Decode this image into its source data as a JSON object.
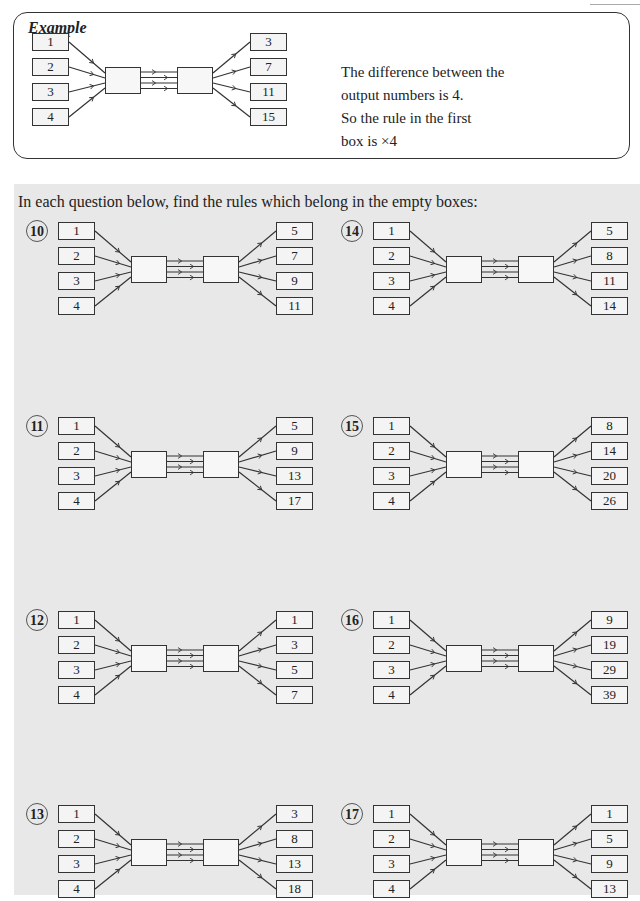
{
  "example": {
    "title": "Example",
    "inputs": [
      "1",
      "2",
      "3",
      "4"
    ],
    "outputs": [
      "3",
      "7",
      "11",
      "15"
    ],
    "explanation": [
      "The difference between the",
      "output numbers is 4.",
      "So the rule in the first",
      "box is ×4"
    ]
  },
  "instruction": "In each question below, find the rules which belong in the empty boxes:",
  "questions": [
    {
      "number": "10",
      "inputs": [
        "1",
        "2",
        "3",
        "4"
      ],
      "outputs": [
        "5",
        "7",
        "9",
        "11"
      ]
    },
    {
      "number": "11",
      "inputs": [
        "1",
        "2",
        "3",
        "4"
      ],
      "outputs": [
        "5",
        "9",
        "13",
        "17"
      ]
    },
    {
      "number": "12",
      "inputs": [
        "1",
        "2",
        "3",
        "4"
      ],
      "outputs": [
        "1",
        "3",
        "5",
        "7"
      ]
    },
    {
      "number": "13",
      "inputs": [
        "1",
        "2",
        "3",
        "4"
      ],
      "outputs": [
        "3",
        "8",
        "13",
        "18"
      ]
    },
    {
      "number": "14",
      "inputs": [
        "1",
        "2",
        "3",
        "4"
      ],
      "outputs": [
        "5",
        "8",
        "11",
        "14"
      ]
    },
    {
      "number": "15",
      "inputs": [
        "1",
        "2",
        "3",
        "4"
      ],
      "outputs": [
        "8",
        "14",
        "20",
        "26"
      ]
    },
    {
      "number": "16",
      "inputs": [
        "1",
        "2",
        "3",
        "4"
      ],
      "outputs": [
        "9",
        "19",
        "29",
        "39"
      ]
    },
    {
      "number": "17",
      "inputs": [
        "1",
        "2",
        "3",
        "4"
      ],
      "outputs": [
        "1",
        "5",
        "9",
        "13"
      ]
    }
  ],
  "colors": {
    "panel": "#e8e8e8",
    "box_fill": "#f4f4f4",
    "stroke": "#333333"
  }
}
